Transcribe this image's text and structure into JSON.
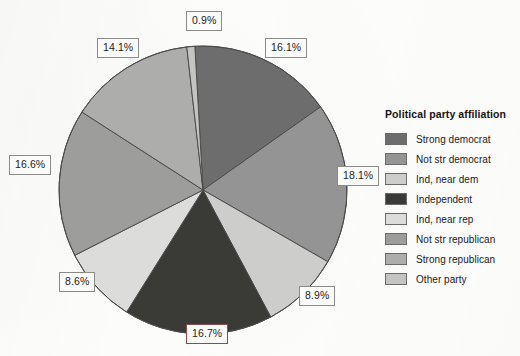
{
  "chart_data": {
    "type": "pie",
    "title": "",
    "legend_title": "Political party affiliation",
    "legend_position": "right",
    "grid": false,
    "start_angle_deg": 0,
    "direction": "clockwise",
    "categories": [
      "Strong democrat",
      "Not str democrat",
      "Ind, near dem",
      "Independent",
      "Ind, near rep",
      "Not str republican",
      "Strong republican",
      "Other party"
    ],
    "values": [
      16.1,
      18.1,
      8.9,
      16.7,
      8.6,
      16.6,
      14.1,
      0.9
    ],
    "value_labels": [
      "16.1%",
      "18.1%",
      "8.9%",
      "16.7%",
      "8.6%",
      "16.6%",
      "14.1%",
      "0.9%"
    ],
    "colors": [
      "#6d6d6d",
      "#949494",
      "#cdcdcb",
      "#3a3a37",
      "#dcdcda",
      "#9d9d9b",
      "#adadab",
      "#c4c4c2"
    ],
    "slice_border_color": "#4c4c4c",
    "units": "percent"
  },
  "labels": [
    {
      "text": "16.1%",
      "accent": false
    },
    {
      "text": "18.1%",
      "accent": false
    },
    {
      "text": "8.9%",
      "accent": false
    },
    {
      "text": "16.7%",
      "accent": true
    },
    {
      "text": "8.6%",
      "accent": false
    },
    {
      "text": "16.6%",
      "accent": false
    },
    {
      "text": "14.1%",
      "accent": false
    },
    {
      "text": "0.9%",
      "accent": false
    }
  ],
  "legend": {
    "title": "Political party affiliation",
    "items": [
      {
        "label": "Strong democrat",
        "color": "#6d6d6d"
      },
      {
        "label": "Not str democrat",
        "color": "#949494"
      },
      {
        "label": "Ind, near dem",
        "color": "#cdcdcb"
      },
      {
        "label": "Independent",
        "color": "#3a3a37"
      },
      {
        "label": "Ind, near rep",
        "color": "#dcdcda"
      },
      {
        "label": "Not str republican",
        "color": "#9d9d9b"
      },
      {
        "label": "Strong republican",
        "color": "#adadab"
      },
      {
        "label": "Other party",
        "color": "#c4c4c2"
      }
    ]
  },
  "accent_color": "#8d4a4f"
}
